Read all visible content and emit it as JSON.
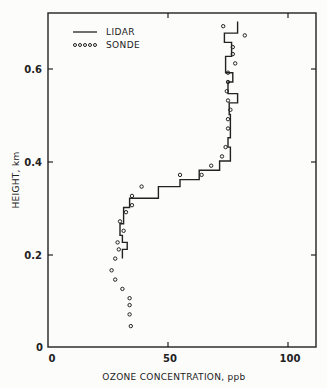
{
  "chart_data": {
    "type": "line",
    "title": "",
    "xlabel": "OZONE CONCENTRATION, ppb",
    "ylabel": "HEIGHT, km",
    "xlim": [
      0,
      111
    ],
    "ylim": [
      0,
      0.72
    ],
    "x_ticks": [
      "0",
      "50",
      "100"
    ],
    "y_ticks": [
      "0",
      "0.2",
      "0.4",
      "0.6"
    ],
    "grid": false,
    "legend_position": "upper left",
    "series": [
      {
        "name": "LIDAR",
        "style": "step-line",
        "points": [
          {
            "ppb": 31,
            "km": 0.19
          },
          {
            "ppb": 31,
            "km": 0.21
          },
          {
            "ppb": 33,
            "km": 0.21
          },
          {
            "ppb": 33,
            "km": 0.225
          },
          {
            "ppb": 31,
            "km": 0.225
          },
          {
            "ppb": 31,
            "km": 0.24
          },
          {
            "ppb": 30,
            "km": 0.24
          },
          {
            "ppb": 30,
            "km": 0.265
          },
          {
            "ppb": 31.5,
            "km": 0.265
          },
          {
            "ppb": 31.5,
            "km": 0.28
          },
          {
            "ppb": 31.5,
            "km": 0.3
          },
          {
            "ppb": 34,
            "km": 0.3
          },
          {
            "ppb": 34,
            "km": 0.32
          },
          {
            "ppb": 46,
            "km": 0.32
          },
          {
            "ppb": 46,
            "km": 0.345
          },
          {
            "ppb": 55,
            "km": 0.345
          },
          {
            "ppb": 55,
            "km": 0.36
          },
          {
            "ppb": 63,
            "km": 0.36
          },
          {
            "ppb": 63,
            "km": 0.38
          },
          {
            "ppb": 71.5,
            "km": 0.38
          },
          {
            "ppb": 71.5,
            "km": 0.4
          },
          {
            "ppb": 76,
            "km": 0.4
          },
          {
            "ppb": 76,
            "km": 0.43
          },
          {
            "ppb": 75,
            "km": 0.43
          },
          {
            "ppb": 75,
            "km": 0.45
          },
          {
            "ppb": 76,
            "km": 0.45
          },
          {
            "ppb": 76,
            "km": 0.5
          },
          {
            "ppb": 75.5,
            "km": 0.5
          },
          {
            "ppb": 75.5,
            "km": 0.525
          },
          {
            "ppb": 79,
            "km": 0.525
          },
          {
            "ppb": 79,
            "km": 0.545
          },
          {
            "ppb": 75,
            "km": 0.545
          },
          {
            "ppb": 75,
            "km": 0.57
          },
          {
            "ppb": 77,
            "km": 0.57
          },
          {
            "ppb": 77,
            "km": 0.59
          },
          {
            "ppb": 74,
            "km": 0.59
          },
          {
            "ppb": 74,
            "km": 0.625
          },
          {
            "ppb": 76.5,
            "km": 0.625
          },
          {
            "ppb": 76.5,
            "km": 0.655
          },
          {
            "ppb": 73.5,
            "km": 0.655
          },
          {
            "ppb": 73.5,
            "km": 0.675
          },
          {
            "ppb": 79,
            "km": 0.675
          },
          {
            "ppb": 79,
            "km": 0.7
          }
        ]
      },
      {
        "name": "SONDE",
        "style": "circle-markers",
        "points": [
          {
            "ppb": 73,
            "km": 0.69
          },
          {
            "ppb": 82,
            "km": 0.67
          },
          {
            "ppb": 77,
            "km": 0.645
          },
          {
            "ppb": 77,
            "km": 0.63
          },
          {
            "ppb": 78,
            "km": 0.61
          },
          {
            "ppb": 75,
            "km": 0.59
          },
          {
            "ppb": 75,
            "km": 0.57
          },
          {
            "ppb": 74.5,
            "km": 0.55
          },
          {
            "ppb": 75,
            "km": 0.53
          },
          {
            "ppb": 76,
            "km": 0.51
          },
          {
            "ppb": 75,
            "km": 0.49
          },
          {
            "ppb": 75,
            "km": 0.47
          },
          {
            "ppb": 74,
            "km": 0.43
          },
          {
            "ppb": 72.5,
            "km": 0.41
          },
          {
            "ppb": 68,
            "km": 0.39
          },
          {
            "ppb": 64,
            "km": 0.37
          },
          {
            "ppb": 55,
            "km": 0.37
          },
          {
            "ppb": 39,
            "km": 0.345
          },
          {
            "ppb": 35,
            "km": 0.325
          },
          {
            "ppb": 35,
            "km": 0.305
          },
          {
            "ppb": 32.5,
            "km": 0.29
          },
          {
            "ppb": 30,
            "km": 0.27
          },
          {
            "ppb": 31.5,
            "km": 0.25
          },
          {
            "ppb": 29,
            "km": 0.225
          },
          {
            "ppb": 29.5,
            "km": 0.21
          },
          {
            "ppb": 28,
            "km": 0.19
          },
          {
            "ppb": 26.5,
            "km": 0.165
          },
          {
            "ppb": 28,
            "km": 0.145
          },
          {
            "ppb": 31,
            "km": 0.125
          },
          {
            "ppb": 34,
            "km": 0.105
          },
          {
            "ppb": 34,
            "km": 0.09
          },
          {
            "ppb": 34,
            "km": 0.07
          },
          {
            "ppb": 34.5,
            "km": 0.045
          }
        ]
      }
    ]
  },
  "axes": {
    "x_title": "OZONE CONCENTRATION, ppb",
    "y_title": "HEIGHT, km",
    "x_tick_labels": [
      "0",
      "50",
      "100"
    ],
    "y_tick_labels": [
      "0",
      "0.2",
      "0.4",
      "0.6"
    ]
  },
  "legend": {
    "items": [
      {
        "label": "LIDAR",
        "symbol": "solid-line"
      },
      {
        "label": "SONDE",
        "symbol": "dotted-circles"
      }
    ]
  },
  "colors": {
    "ink": "#222222",
    "background": "#fcfcfb"
  }
}
